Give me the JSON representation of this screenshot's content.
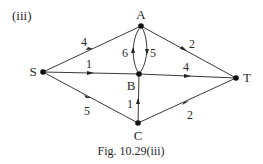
{
  "figure": {
    "panel_label": "(iii)",
    "caption": "Fig. 10.29(iii)"
  },
  "nodes": [
    {
      "id": "A",
      "label": "A",
      "x": 141,
      "y": 26,
      "lx": 141,
      "ly": 19
    },
    {
      "id": "S",
      "label": "S",
      "x": 43,
      "y": 72,
      "lx": 33,
      "ly": 76
    },
    {
      "id": "B",
      "label": "B",
      "x": 139,
      "y": 74,
      "lx": 131,
      "ly": 90
    },
    {
      "id": "T",
      "label": "T",
      "x": 236,
      "y": 78,
      "lx": 247,
      "ly": 82
    },
    {
      "id": "C",
      "label": "C",
      "x": 138,
      "y": 123,
      "lx": 138,
      "ly": 140
    }
  ],
  "edges": [
    {
      "from": "S",
      "to": "A",
      "weight": "4"
    },
    {
      "from": "S",
      "to": "B",
      "weight": "1"
    },
    {
      "from": "S",
      "to": "C",
      "weight": "5"
    },
    {
      "from": "A",
      "to": "T",
      "weight": "2"
    },
    {
      "from": "B",
      "to": "T",
      "weight": "4"
    },
    {
      "from": "C",
      "to": "T",
      "weight": "2"
    },
    {
      "from": "B",
      "to": "A",
      "weight": "6"
    },
    {
      "from": "A",
      "to": "B",
      "weight": "5"
    },
    {
      "from": "C",
      "to": "B",
      "weight": "1"
    }
  ],
  "labels": {
    "S_A": "4",
    "S_B": "1",
    "S_C": "5",
    "A_T": "2",
    "B_T": "4",
    "C_T": "2",
    "B_A": "6",
    "A_B": "5",
    "C_B": "1"
  }
}
